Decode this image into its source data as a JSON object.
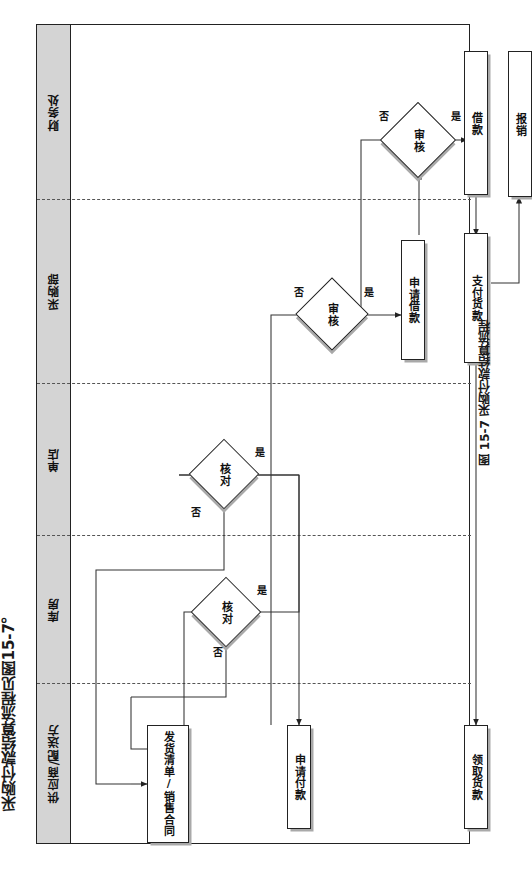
{
  "document": {
    "title": "采购付款结算流程见图15-7。",
    "caption": "图 15-7  采购付款结算流程"
  },
  "diagram": {
    "type": "cross-functional-flowchart",
    "orientation": "rotated-90",
    "lanes": [
      {
        "id": "finance",
        "label": "财务处"
      },
      {
        "id": "purchase",
        "label": "采购部"
      },
      {
        "id": "store",
        "label": "单店"
      },
      {
        "id": "warehouse",
        "label": "库房"
      },
      {
        "id": "supplier",
        "label": "供应商/配送方"
      }
    ],
    "nodes": [
      {
        "id": "n_jiekuan",
        "lane": "finance",
        "shape": "process",
        "label": "借款"
      },
      {
        "id": "n_baoxiao",
        "lane": "finance",
        "shape": "process",
        "label": "报销"
      },
      {
        "id": "n_shenhe_fin",
        "lane": "finance",
        "shape": "decision",
        "label": "审核"
      },
      {
        "id": "n_shenhe_pur",
        "lane": "purchase",
        "shape": "decision",
        "label": "审核"
      },
      {
        "id": "n_sqjiekuan",
        "lane": "purchase",
        "shape": "process",
        "label": "申请借款"
      },
      {
        "id": "n_zfhuokuan",
        "lane": "purchase",
        "shape": "process",
        "label": "支付货款"
      },
      {
        "id": "n_hedui_store",
        "lane": "store",
        "shape": "decision",
        "label": "核对"
      },
      {
        "id": "n_hedui_wh",
        "lane": "warehouse",
        "shape": "decision",
        "label": "核对"
      },
      {
        "id": "n_fahuo",
        "lane": "supplier",
        "shape": "process",
        "label": "发货清单/销售合同"
      },
      {
        "id": "n_sqfukuan",
        "lane": "supplier",
        "shape": "process",
        "label": "申请付款"
      },
      {
        "id": "n_lqhuokuan",
        "lane": "supplier",
        "shape": "process",
        "label": "领取货款"
      }
    ],
    "edge_labels": {
      "yes": "是",
      "no": "否"
    },
    "edges": [
      {
        "from": "n_fahuo",
        "to": "n_hedui_wh",
        "label": ""
      },
      {
        "from": "n_hedui_wh",
        "to": "n_fahuo",
        "label": "否"
      },
      {
        "from": "n_hedui_wh",
        "to": "n_hedui_store",
        "label": "是"
      },
      {
        "from": "n_hedui_store",
        "to": "n_fahuo",
        "label": "否"
      },
      {
        "from": "n_hedui_store",
        "to": "n_sqfukuan",
        "label": "是"
      },
      {
        "from": "n_sqfukuan",
        "to": "n_shenhe_pur",
        "label": ""
      },
      {
        "from": "n_shenhe_pur",
        "to": "n_sqjiekuan",
        "label": "是"
      },
      {
        "from": "n_shenhe_pur",
        "to": "n_sqfukuan",
        "label": "否"
      },
      {
        "from": "n_sqjiekuan",
        "to": "n_shenhe_fin",
        "label": ""
      },
      {
        "from": "n_shenhe_fin",
        "to": "n_jiekuan",
        "label": "是"
      },
      {
        "from": "n_shenhe_fin",
        "to": "n_sqjiekuan",
        "label": "否"
      },
      {
        "from": "n_jiekuan",
        "to": "n_zfhuokuan",
        "label": ""
      },
      {
        "from": "n_zfhuokuan",
        "to": "n_lqhuokuan",
        "label": ""
      },
      {
        "from": "n_zfhuokuan",
        "to": "n_baoxiao",
        "label": ""
      }
    ],
    "colors": {
      "lane_header_fill": "#d4d4d4",
      "node_fill": "#ffffff",
      "stroke": "#222222",
      "shadow": "#a9a9a9",
      "separator": "#555555"
    }
  }
}
